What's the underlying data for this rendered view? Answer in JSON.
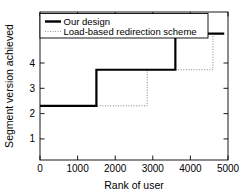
{
  "chart_data": {
    "type": "line",
    "subtype": "step",
    "title": "",
    "xlabel": "Rank of user",
    "ylabel": "Segment version achieved",
    "xlim": [
      0,
      5000
    ],
    "ylim": [
      0.5,
      4.6
    ],
    "xticks": [
      0,
      1000,
      2000,
      3000,
      4000,
      5000
    ],
    "xticklabels": [
      "0",
      "1000",
      "2000",
      "3000",
      "4000",
      "5000"
    ],
    "yticks": [
      1,
      2,
      3,
      4
    ],
    "yticklabels": [
      "1",
      "2",
      "3",
      "4"
    ],
    "grid": false,
    "legend_position": "upper left",
    "series": [
      {
        "name": "Our design",
        "style": "solid",
        "color": "#000000",
        "linewidth": 2.2,
        "x": [
          0,
          1500,
          1500,
          3600,
          3600,
          4900
        ],
        "y": [
          2,
          2,
          3,
          3,
          4,
          4
        ],
        "steps": [
          {
            "x_start": 0,
            "x_end": 1500,
            "value": 2
          },
          {
            "x_start": 1500,
            "x_end": 3600,
            "value": 3
          },
          {
            "x_start": 3600,
            "x_end": 4900,
            "value": 4
          }
        ]
      },
      {
        "name": "Load-based redirection scheme",
        "style": "dotted",
        "color": "#808080",
        "linewidth": 1.0,
        "x": [
          0,
          2850,
          2850,
          4600,
          4600,
          4900
        ],
        "y": [
          2,
          2,
          3,
          3,
          4,
          4
        ],
        "steps": [
          {
            "x_start": 0,
            "x_end": 2850,
            "value": 2
          },
          {
            "x_start": 2850,
            "x_end": 4600,
            "value": 3
          },
          {
            "x_start": 4600,
            "x_end": 4900,
            "value": 4
          }
        ]
      }
    ]
  },
  "legend": {
    "entries": [
      {
        "label": "Our design",
        "marker": "solid-line-swatch"
      },
      {
        "label": "Load-based redirection scheme",
        "marker": "dotted-line-swatch"
      }
    ]
  },
  "colors": {
    "axis": "#000000",
    "series_primary": "#000000",
    "series_secondary": "#808080",
    "background": "#ffffff"
  }
}
